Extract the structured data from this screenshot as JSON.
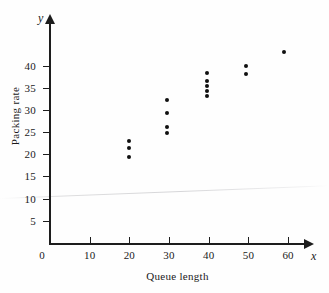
{
  "chart_data": {
    "type": "scatter",
    "title": "",
    "xlabel": "Queue length",
    "ylabel": "Packing rate",
    "x_axis_variable": "x",
    "y_axis_variable": "y",
    "xlim": [
      0,
      64
    ],
    "ylim": [
      0,
      48
    ],
    "grid": false,
    "legend": null,
    "x_ticks": [
      0,
      10,
      20,
      30,
      40,
      50,
      60
    ],
    "x_tick_labels": [
      "0",
      "10",
      "20",
      "30",
      "40",
      "50",
      "60"
    ],
    "y_ticks": [
      5,
      10,
      15,
      20,
      25,
      30,
      35,
      40
    ],
    "y_tick_labels": [
      "5",
      "10",
      "15",
      "20",
      "25",
      "30",
      "35",
      "40"
    ],
    "points": [
      {
        "x": 20,
        "y": 23.0
      },
      {
        "x": 20,
        "y": 21.4
      },
      {
        "x": 20,
        "y": 19.4
      },
      {
        "x": 29.5,
        "y": 32.3
      },
      {
        "x": 29.5,
        "y": 29.3
      },
      {
        "x": 29.5,
        "y": 26.1
      },
      {
        "x": 29.5,
        "y": 24.7
      },
      {
        "x": 39.5,
        "y": 38.3
      },
      {
        "x": 39.5,
        "y": 36.6
      },
      {
        "x": 39.5,
        "y": 35.3
      },
      {
        "x": 39.5,
        "y": 34.2
      },
      {
        "x": 39.5,
        "y": 33.1
      },
      {
        "x": 49.5,
        "y": 40.0
      },
      {
        "x": 49.5,
        "y": 38.0
      },
      {
        "x": 59.0,
        "y": 43.0
      }
    ]
  },
  "colors": {
    "marker": "#101010",
    "axis": "#1d1d1d",
    "background": "#fefefe"
  }
}
